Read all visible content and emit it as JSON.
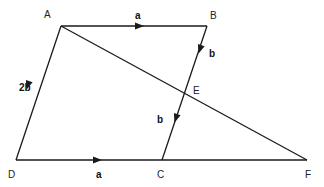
{
  "diagram": {
    "type": "vector-geometry",
    "points": {
      "A": "A",
      "B": "B",
      "C": "C",
      "D": "D",
      "E": "E",
      "F": "F"
    },
    "vectors": {
      "AB": "a",
      "BE": "b",
      "AD": "2b",
      "EC": "b",
      "DC": "a"
    },
    "segments": [
      "AB",
      "BC",
      "AD",
      "DF",
      "AF"
    ],
    "color": "#1a1a1a"
  }
}
